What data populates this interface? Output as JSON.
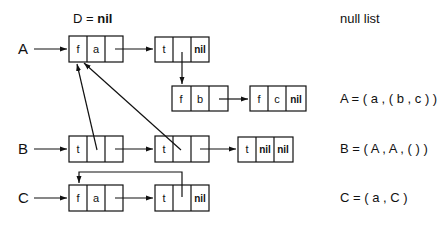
{
  "header": {
    "d_label": "D = ",
    "d_value": "nil",
    "null_list_label": "null list"
  },
  "rows": {
    "A": {
      "name": "A",
      "expression": "A = ( a , ( b , c ) )",
      "nodes": [
        {
          "tag": "f",
          "data": "a",
          "link": ""
        },
        {
          "tag": "t",
          "data": "",
          "link": "nil"
        },
        {
          "tag": "f",
          "data": "b",
          "link": ""
        },
        {
          "tag": "f",
          "data": "c",
          "link": "nil"
        }
      ]
    },
    "B": {
      "name": "B",
      "expression": "B = ( A , A , (  ) )",
      "nodes": [
        {
          "tag": "t",
          "data": "",
          "link": ""
        },
        {
          "tag": "t",
          "data": "",
          "link": ""
        },
        {
          "tag": "t",
          "data": "nil",
          "link": "nil"
        }
      ]
    },
    "C": {
      "name": "C",
      "expression": "C = ( a , C )",
      "nodes": [
        {
          "tag": "f",
          "data": "a",
          "link": ""
        },
        {
          "tag": "t",
          "data": "",
          "link": "nil"
        }
      ]
    }
  },
  "colors": {
    "stroke": "#111111",
    "background": "#ffffff"
  }
}
